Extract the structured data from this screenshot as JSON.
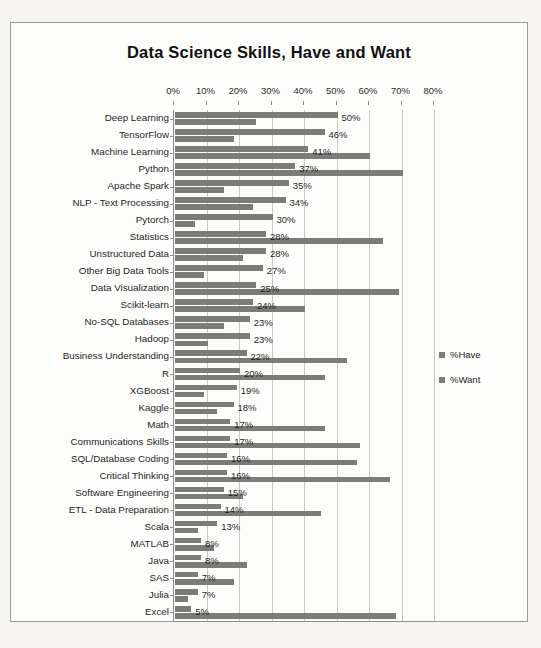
{
  "chart_data": {
    "type": "bar",
    "orientation": "horizontal",
    "title": "Data Science Skills, Have and Want",
    "xlabel": "",
    "ylabel": "",
    "xlim": [
      0,
      80
    ],
    "xticks": [
      "0%",
      "10%",
      "20%",
      "30%",
      "40%",
      "50%",
      "60%",
      "70%",
      "80%"
    ],
    "xtick_values": [
      0,
      10,
      20,
      30,
      40,
      50,
      60,
      70,
      80
    ],
    "grid": true,
    "legend_position": "right",
    "legend": [
      "%Have",
      "%Want"
    ],
    "bar_color": "#7b7b78",
    "categories": [
      "Deep Learning",
      "TensorFlow",
      "Machine Learning",
      "Python",
      "Apache Spark",
      "NLP - Text Processing",
      "Pytorch",
      "Statistics",
      "Unstructured Data",
      "Other Big Data Tools",
      "Data Visualization",
      "Scikit-learn",
      "No-SQL Databases",
      "Hadoop",
      "Business Understanding",
      "R",
      "XGBoost",
      "Kaggle",
      "Math",
      "Communications Skills",
      "SQL/Database Coding",
      "Critical Thinking",
      "Software Engineering",
      "ETL - Data Preparation",
      "Scala",
      "MATLAB",
      "Java",
      "SAS",
      "Julia",
      "Excel"
    ],
    "series": [
      {
        "name": "%Want",
        "values": [
          50,
          46,
          41,
          37,
          35,
          34,
          30,
          28,
          28,
          27,
          25,
          24,
          23,
          23,
          22,
          20,
          19,
          18,
          17,
          17,
          16,
          16,
          15,
          14,
          13,
          8,
          8,
          7,
          7,
          5
        ]
      },
      {
        "name": "%Have",
        "values": [
          25,
          18,
          60,
          70,
          15,
          24,
          6,
          64,
          21,
          9,
          69,
          40,
          15,
          10,
          53,
          46,
          9,
          13,
          46,
          57,
          56,
          66,
          21,
          45,
          7,
          12,
          22,
          18,
          4,
          68
        ]
      }
    ],
    "data_labels": [
      "50%",
      "46%",
      "41%",
      "37%",
      "35%",
      "34%",
      "30%",
      "28%",
      "28%",
      "27%",
      "25%",
      "24%",
      "23%",
      "23%",
      "22%",
      "20%",
      "19%",
      "18%",
      "17%",
      "17%",
      "16%",
      "16%",
      "15%",
      "14%",
      "13%",
      "8%",
      "8%",
      "7%",
      "7%",
      "5%"
    ]
  }
}
